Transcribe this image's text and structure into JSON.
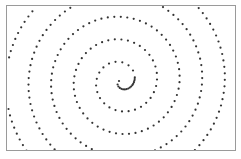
{
  "chart_data": {
    "type": "scatter",
    "title": "",
    "xlabel": "",
    "ylabel": "",
    "grid": false,
    "legend": null,
    "spiral": {
      "center_px": [
        114,
        75
      ],
      "start_radius": 2,
      "growth_per_radian": 3.6,
      "turns": 5.2,
      "arc_step_px": 6.5,
      "dense_arc_step_px": 1.6,
      "dense_until_radius": 14
    },
    "marker": {
      "color": "#333333",
      "size": 1.1
    }
  }
}
